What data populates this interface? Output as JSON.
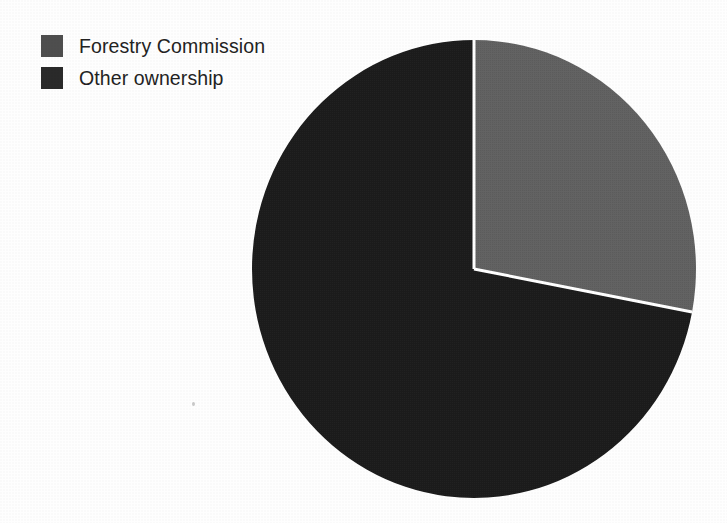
{
  "chart_data": {
    "type": "pie",
    "title": "",
    "subtitle": "",
    "xlabel": "",
    "ylabel": "",
    "grid": false,
    "legend_position": "top-left",
    "start_angle_deg": 0,
    "direction": "clockwise",
    "categories": [
      "Forestry Commission",
      "Other ownership"
    ],
    "values": [
      28,
      72
    ],
    "unit": "percent",
    "slices": [
      {
        "label": "Forestry Commission",
        "value": 28,
        "color": "#636363",
        "start_angle_deg": 0,
        "end_angle_deg": 100.8
      },
      {
        "label": "Other ownership",
        "value": 72,
        "color": "#1b1b1b",
        "start_angle_deg": 100.8,
        "end_angle_deg": 360
      }
    ]
  },
  "legend": {
    "items": [
      {
        "label": "Forestry Commission",
        "swatch": "forestry-swatch",
        "color": "#636363"
      },
      {
        "label": "Other ownership",
        "swatch": "other-swatch",
        "color": "#1b1b1b"
      }
    ]
  },
  "geometry": {
    "center_x": 224,
    "center_y": 231,
    "radius_x": 222,
    "radius_y": 229,
    "separator_color": "#ffffff",
    "separator_width": 3
  },
  "colors": {
    "background": "#fefefe",
    "forestry": "#636363",
    "other": "#1b1b1b",
    "text": "#232323",
    "separator": "#ffffff"
  }
}
